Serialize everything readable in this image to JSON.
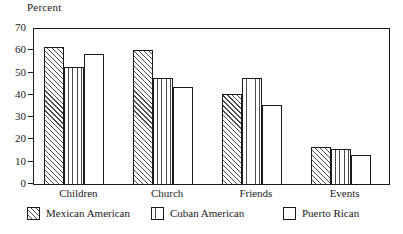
{
  "chart_data": {
    "type": "bar",
    "title": "",
    "xlabel": "",
    "ylabel": "Percent",
    "ylim": [
      0,
      70
    ],
    "yticks": [
      0,
      10,
      20,
      30,
      40,
      50,
      60,
      70
    ],
    "ytick_labels": [
      "0",
      "10",
      "20",
      "30",
      "40",
      "50",
      "60",
      "70"
    ],
    "grid": false,
    "legend_position": "bottom",
    "categories": [
      "Children",
      "Church",
      "Friends",
      "Events"
    ],
    "series": [
      {
        "name": "Mexican American",
        "pattern": "diagonal-hatch",
        "values": [
          62,
          60.5,
          41,
          17
        ]
      },
      {
        "name": "Cuban American",
        "pattern": "vertical-lines",
        "values": [
          53,
          48,
          48,
          16
        ]
      },
      {
        "name": "Puerto Rican",
        "pattern": "empty",
        "values": [
          59,
          44,
          36,
          13.5
        ]
      }
    ],
    "colors": {
      "axis": "#1a1a1a",
      "bar_outline": "#1a1a1a",
      "bar_fill": "#ffffff",
      "hatch": "#4a4a4a",
      "background": "#ffffff"
    }
  }
}
